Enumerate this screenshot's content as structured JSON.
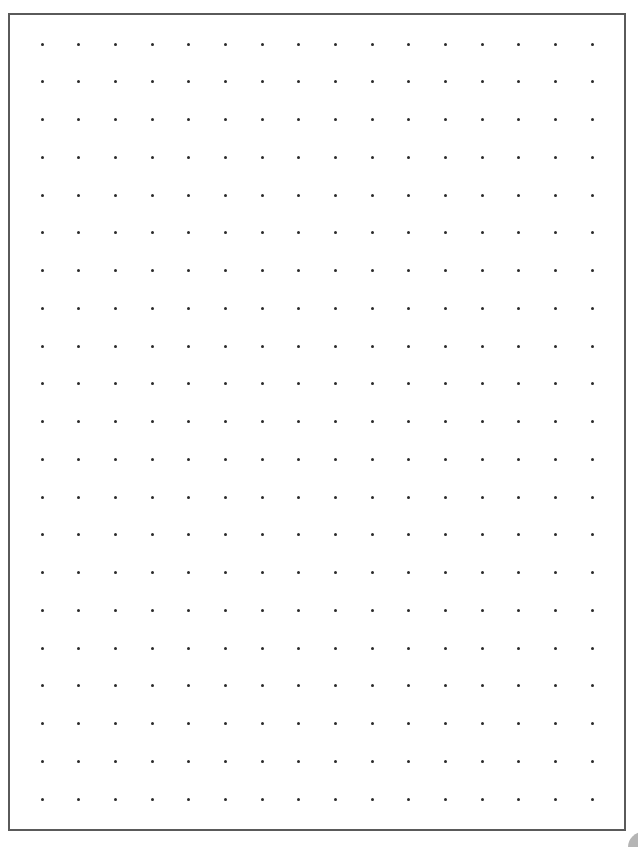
{
  "sheet": {
    "type": "dot-grid-paper",
    "columns": 16,
    "rows": 21,
    "dot_color": "#2a2a2a",
    "border_color": "#5a5a5a",
    "background_color": "#ffffff",
    "first_dot": {
      "x": 42,
      "y": 44
    },
    "last_dot": {
      "x": 592,
      "y": 799
    }
  },
  "corner_indicator": {
    "color": "#b5b5b5"
  }
}
